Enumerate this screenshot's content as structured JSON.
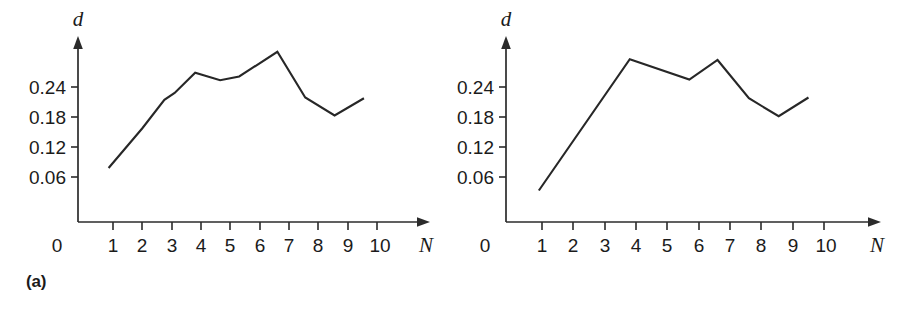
{
  "figure": {
    "background_color": "#ffffff",
    "line_color": "#272727",
    "axis_color": "#2b2b2b"
  },
  "panels": [
    {
      "caption": "(a)",
      "caption_name": "panel-a-caption"
    },
    {
      "caption": "(b)",
      "caption_name": "panel-b-caption"
    }
  ],
  "axis": {
    "y_label": "d",
    "x_label": "N",
    "origin_label": "0",
    "y_ticks": [
      "0.06",
      "0.12",
      "0.18",
      "0.24"
    ],
    "x_ticks": [
      "1",
      "2",
      "3",
      "4",
      "5",
      "6",
      "7",
      "8",
      "9",
      "10"
    ]
  },
  "chart_data": [
    {
      "type": "line",
      "title": "(a)",
      "xlabel": "N",
      "ylabel": "d",
      "xlim": [
        0,
        10.6
      ],
      "ylim": [
        0,
        0.285
      ],
      "grid": false,
      "legend": "none",
      "x": [
        0.85,
        2.0,
        2.75,
        3.1,
        3.8,
        4.65,
        5.3,
        6.6,
        7.55,
        8.55,
        9.55
      ],
      "y": [
        0.072,
        0.125,
        0.163,
        0.172,
        0.199,
        0.189,
        0.194,
        0.227,
        0.166,
        0.142,
        0.165
      ],
      "y_ticks": [
        0.06,
        0.12,
        0.18,
        0.24
      ],
      "x_ticks": [
        1,
        2,
        3,
        4,
        5,
        6,
        7,
        8,
        9,
        10
      ]
    },
    {
      "type": "line",
      "title": "(b)",
      "xlabel": "N",
      "ylabel": "d",
      "xlim": [
        0,
        10.6
      ],
      "ylim": [
        0,
        0.285
      ],
      "grid": false,
      "legend": "none",
      "x": [
        0.9,
        3.8,
        5.7,
        6.6,
        7.6,
        8.55,
        9.5
      ],
      "y": [
        0.042,
        0.217,
        0.19,
        0.216,
        0.165,
        0.141,
        0.166
      ],
      "y_ticks": [
        0.06,
        0.12,
        0.18,
        0.24
      ],
      "x_ticks": [
        1,
        2,
        3,
        4,
        5,
        6,
        7,
        8,
        9,
        10
      ]
    }
  ]
}
